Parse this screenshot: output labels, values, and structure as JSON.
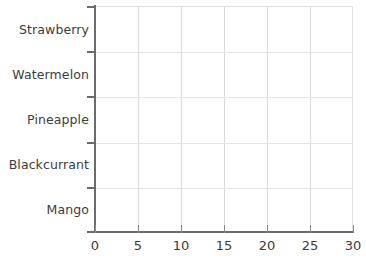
{
  "chart_data": {
    "type": "bar",
    "orientation": "horizontal",
    "title": "",
    "subtitle": "",
    "xlabel": "",
    "ylabel": "",
    "categories": [
      "Mango",
      "Blackcurrant",
      "Pineapple",
      "Watermelon",
      "Strawberry"
    ],
    "values": [
      null,
      null,
      null,
      null,
      null
    ],
    "series": [
      {
        "name": "",
        "values": [
          null,
          null,
          null,
          null,
          null
        ]
      }
    ],
    "xlim": [
      0,
      30
    ],
    "xticks": [
      0,
      5,
      10,
      15,
      20,
      25,
      30
    ],
    "xtick_labels": [
      "0",
      "5",
      "10",
      "15",
      "20",
      "25",
      "30"
    ],
    "ytick_labels": [
      "Mango",
      "Blackcurrant",
      "Pineapple",
      "Watermelon",
      "Strawberry"
    ],
    "grid": true,
    "grid_axis": "both",
    "legend": false,
    "legend_position": "none",
    "annotations": [],
    "note": "Empty plot template: axes and gridlines drawn, no bars plotted"
  },
  "style": {
    "background": "#ffffff",
    "axis_color": "#6b6b6b",
    "grid_color": "#d9d9d9",
    "grid_color_horizontal": "#e4e4e4",
    "text_color": "#3c3c3c",
    "frame_top_color": "#e3e3e3",
    "frame_right_color": "#e0e0e0"
  },
  "axes": {
    "x": {
      "ticks": [
        {
          "value": 0,
          "label": "0"
        },
        {
          "value": 5,
          "label": "5"
        },
        {
          "value": 10,
          "label": "10"
        },
        {
          "value": 15,
          "label": "15"
        },
        {
          "value": 20,
          "label": "20"
        },
        {
          "value": 25,
          "label": "25"
        },
        {
          "value": 30,
          "label": "30"
        }
      ]
    },
    "y": {
      "categories": [
        {
          "index": 0,
          "label": "Strawberry"
        },
        {
          "index": 1,
          "label": "Watermelon"
        },
        {
          "index": 2,
          "label": "Pineapple"
        },
        {
          "index": 3,
          "label": "Blackcurrant"
        },
        {
          "index": 4,
          "label": "Mango"
        }
      ]
    }
  }
}
